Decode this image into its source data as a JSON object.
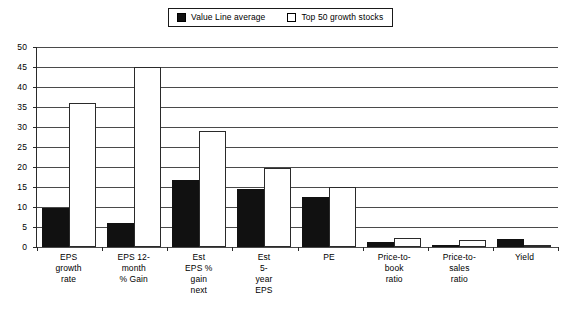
{
  "legend": {
    "position": "top-center",
    "entries": [
      {
        "label": "Value Line average",
        "swatch": "filled-square-icon",
        "color": "#111111"
      },
      {
        "label": "Top 50 growth stocks",
        "swatch": "hollow-square-icon",
        "color": "#ffffff"
      }
    ]
  },
  "axis": {
    "y_ticks": [
      "0",
      "5",
      "10",
      "15",
      "20",
      "25",
      "30",
      "35",
      "40",
      "45",
      "50"
    ]
  },
  "chart_data": {
    "type": "bar",
    "title": "",
    "subtitle": "",
    "xlabel": "",
    "ylabel": "",
    "ylim": [
      0,
      50
    ],
    "ytick_step": 5,
    "grid": true,
    "legend_position": "top-center",
    "categories": [
      "EPS growth rate",
      "EPS 12-month % Gain",
      "Est EPS % gain next",
      "Est 5-year EPS",
      "PE",
      "Price-to-book ratio",
      "Price-to-sales ratio",
      "Yield"
    ],
    "category_lines": [
      [
        "EPS",
        "growth",
        "rate"
      ],
      [
        "EPS 12-",
        "month",
        "% Gain"
      ],
      [
        "Est",
        "EPS %",
        "gain",
        "next"
      ],
      [
        "Est",
        "5-",
        "year",
        "EPS"
      ],
      [
        "PE"
      ],
      [
        "Price-to-",
        "book",
        "ratio"
      ],
      [
        "Price-to-",
        "sales",
        "ratio"
      ],
      [
        "Yield"
      ]
    ],
    "series": [
      {
        "name": "Value Line average",
        "color": "#111111",
        "values": [
          9.7,
          5.9,
          16.8,
          14.4,
          12.4,
          1.3,
          0.5,
          2.0
        ]
      },
      {
        "name": "Top 50 growth stocks",
        "color": "#ffffff",
        "values": [
          36.0,
          45.0,
          29.0,
          19.8,
          15.0,
          2.3,
          1.8,
          0.3
        ]
      }
    ]
  }
}
